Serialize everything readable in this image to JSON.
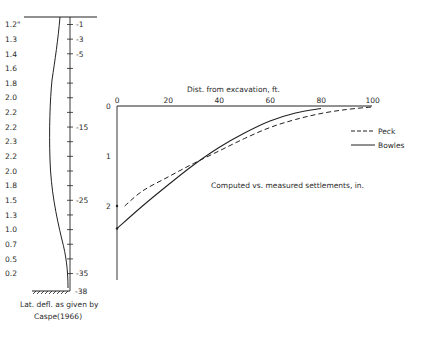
{
  "left_diagram": {
    "deflection_labels": [
      "1.2\"",
      "1.3",
      "1.4",
      "1.6",
      "1.8",
      "2.0",
      "2.2",
      "2.2",
      "2.3",
      "2.2",
      "2.0",
      "1.8",
      "1.5",
      "1.3",
      "1.0",
      "0.7",
      "0.5",
      "0.2"
    ],
    "depth_labels": [
      {
        "label": "-1",
        "index": 0
      },
      {
        "label": "-3",
        "index": 1
      },
      {
        "label": "-5",
        "index": 2
      },
      {
        "label": "-15",
        "index": 7
      },
      {
        "label": "-25",
        "index": 12
      },
      {
        "label": "-35",
        "index": 17
      }
    ],
    "bottom_depth_label": "-38",
    "caption_line1": "Lat. defl. as given by",
    "caption_line2": "Caspe(1966)"
  },
  "chart_data": {
    "type": "line",
    "title": "Computed vs. measured settlements, in.",
    "xlabel": "Dist. from excavation, ft.",
    "ylabel": "Settlement, in.",
    "x_ticks": [
      "0",
      "20",
      "40",
      "60",
      "80",
      "100"
    ],
    "y_ticks": [
      "0",
      "1",
      "2"
    ],
    "xlim": [
      0,
      100
    ],
    "ylim": [
      0,
      2.7
    ],
    "y_inverted": true,
    "legend_position": "right",
    "series": [
      {
        "name": "Peck",
        "style": "dashed",
        "x": [
          0,
          10,
          20,
          30,
          40,
          50,
          60,
          70,
          80,
          90,
          100
        ],
        "y": [
          2.0,
          1.7,
          1.42,
          1.15,
          0.9,
          0.65,
          0.43,
          0.27,
          0.15,
          0.07,
          0.02
        ]
      },
      {
        "name": "Bowles",
        "style": "solid",
        "x": [
          0,
          10,
          20,
          30,
          40,
          50,
          60,
          70,
          80
        ],
        "y": [
          2.45,
          2.0,
          1.58,
          1.18,
          0.83,
          0.54,
          0.3,
          0.14,
          0.05
        ]
      }
    ],
    "annotations": [
      {
        "text": "Measured",
        "x": 0,
        "y": 2.0,
        "marker": "dot"
      }
    ]
  },
  "legend": {
    "peck": "Peck",
    "bowles": "Bowles"
  }
}
